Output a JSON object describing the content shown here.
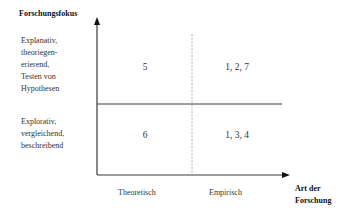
{
  "y_axis": {
    "title": "Forschungsfokus",
    "categories": [
      {
        "label_lines": [
          "Explanativ,",
          "theoriegen-",
          "erierend,",
          "Testen von",
          "Hypothesen"
        ]
      },
      {
        "label_lines": [
          "Explorativ,",
          "vergleichend,",
          "beschreibend"
        ]
      }
    ]
  },
  "x_axis": {
    "title_lines": [
      "Art der",
      "Forschung"
    ],
    "categories": [
      "Theoretisch",
      "Empirisch"
    ]
  },
  "cells": {
    "top_left": "5",
    "top_right": "1, 2, 7",
    "bottom_left": "6",
    "bottom_right": "1, 3, 4"
  },
  "colors": {
    "axis": "#333333",
    "divider_dashed": "#9a9a9a"
  }
}
